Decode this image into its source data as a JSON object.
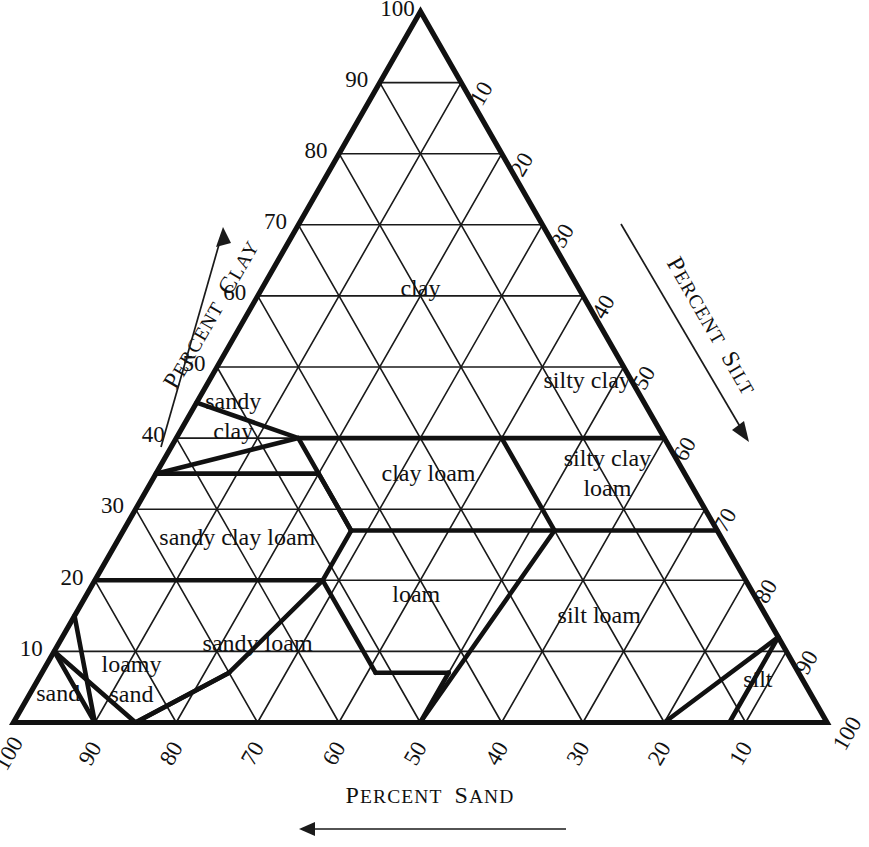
{
  "figure": {
    "kind": "soil-texture-triangle",
    "background_color": "#ffffff",
    "line_color": "#111111"
  },
  "axes": {
    "clay": {
      "title": "Percent Clay",
      "title_caps": "P",
      "title_rest": "ERCENT ",
      "title_caps2": "C",
      "title_rest2": "LAY",
      "arrow_direction": "up-right",
      "ticks": [
        "10",
        "20",
        "30",
        "40",
        "50",
        "60",
        "70",
        "80",
        "90",
        "100"
      ]
    },
    "silt": {
      "title": "Percent Silt",
      "arrow_direction": "down-right",
      "ticks": [
        "10",
        "20",
        "30",
        "40",
        "50",
        "60",
        "70",
        "80",
        "90",
        "100"
      ]
    },
    "sand": {
      "title": "Percent Sand",
      "arrow_direction": "left",
      "ticks": [
        "100",
        "90",
        "80",
        "70",
        "60",
        "50",
        "40",
        "30",
        "20",
        "10"
      ]
    }
  },
  "chart_data": {
    "type": "ternary-classification",
    "title": "",
    "xlabel": "Percent Sand",
    "ylabel": "Percent Clay",
    "zlabel": "Percent Silt",
    "grid": true,
    "grid_interval": 10,
    "axis_range": [
      0,
      100
    ],
    "classes": [
      {
        "name": "clay",
        "label": "clay",
        "label_lines": [
          "clay"
        ],
        "centroid": {
          "sand": 20,
          "silt": 20,
          "clay": 60
        }
      },
      {
        "name": "silty-clay",
        "label": "silty clay",
        "label_lines": [
          "silty clay"
        ],
        "centroid": {
          "sand": 6,
          "silt": 47,
          "clay": 47
        }
      },
      {
        "name": "sandy-clay",
        "label": "sandy clay",
        "label_lines": [
          "sandy",
          "clay"
        ],
        "centroid": {
          "sand": 52,
          "silt": 6,
          "clay": 42
        }
      },
      {
        "name": "clay-loam",
        "label": "clay loam",
        "label_lines": [
          "clay loam"
        ],
        "centroid": {
          "sand": 32,
          "silt": 34,
          "clay": 34
        }
      },
      {
        "name": "silty-clay-loam",
        "label": "silty clay loam",
        "label_lines": [
          "silty clay",
          "loam"
        ],
        "centroid": {
          "sand": 10,
          "silt": 56,
          "clay": 34
        }
      },
      {
        "name": "sandy-clay-loam",
        "label": "sandy clay loam",
        "label_lines": [
          "sandy clay loam"
        ],
        "centroid": {
          "sand": 60,
          "silt": 15,
          "clay": 25
        }
      },
      {
        "name": "loam",
        "label": "loam",
        "label_lines": [
          "loam"
        ],
        "centroid": {
          "sand": 42,
          "silt": 41,
          "clay": 17
        }
      },
      {
        "name": "silt-loam",
        "label": "silt loam",
        "label_lines": [
          "silt loam"
        ],
        "centroid": {
          "sand": 21,
          "silt": 65,
          "clay": 14
        }
      },
      {
        "name": "sandy-loam",
        "label": "sandy loam",
        "label_lines": [
          "sandy loam"
        ],
        "centroid": {
          "sand": 65,
          "silt": 25,
          "clay": 10
        }
      },
      {
        "name": "silt",
        "label": "silt",
        "label_lines": [
          "silt"
        ],
        "centroid": {
          "sand": 6,
          "silt": 89,
          "clay": 5
        }
      },
      {
        "name": "loamy-sand",
        "label": "loamy sand",
        "label_lines": [
          "loamy",
          "sand"
        ],
        "centroid": {
          "sand": 83,
          "silt": 12,
          "clay": 5
        }
      },
      {
        "name": "sand",
        "label": "sand",
        "label_lines": [
          "sand"
        ],
        "centroid": {
          "sand": 93,
          "silt": 4,
          "clay": 3
        }
      }
    ],
    "tick_values": [
      10,
      20,
      30,
      40,
      50,
      60,
      70,
      80,
      90,
      100
    ]
  }
}
